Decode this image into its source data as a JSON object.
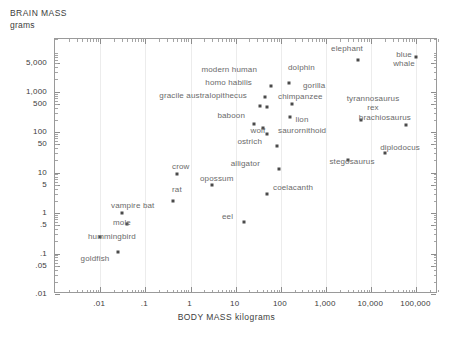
{
  "chart_data": {
    "type": "scatter",
    "title": "",
    "ylabel": "BRAIN MASS",
    "yunit": "grams",
    "xlabel": "BODY MASS kilograms",
    "xscale": "log",
    "yscale": "log",
    "xlim": [
      0.001,
      300000
    ],
    "ylim": [
      0.01,
      20000
    ],
    "grid": true,
    "legend": "none",
    "xticklabels": [
      ".01",
      ".1",
      "1",
      "10",
      "100",
      "1,000",
      "10,000",
      "100,000"
    ],
    "xtickvalues": [
      0.01,
      0.1,
      1,
      10,
      100,
      1000,
      10000,
      100000
    ],
    "yticklabels": [
      "5,000",
      "1,000",
      "500",
      "100",
      "50",
      "10",
      "5",
      "1",
      ".5",
      ".1",
      ".05",
      ".01"
    ],
    "ytickvalues": [
      5000,
      1000,
      500,
      100,
      50,
      10,
      5,
      1,
      0.5,
      0.1,
      0.05,
      0.01
    ],
    "points": [
      {
        "label": "blue whale",
        "x": 100000,
        "y": 7000,
        "lx": 404,
        "ly": 50,
        "anchor": "below",
        "lines": [
          "blue",
          "whale"
        ]
      },
      {
        "label": "elephant",
        "x": 5000,
        "y": 6000,
        "lx": 363,
        "ly": 48,
        "anchor": "left"
      },
      {
        "label": "modern human",
        "x": 60,
        "y": 1400,
        "lx": 257,
        "ly": 69,
        "anchor": "left"
      },
      {
        "label": "dolphin",
        "x": 150,
        "y": 1600,
        "lx": 288,
        "ly": 67,
        "anchor": "right"
      },
      {
        "label": "homo habilis",
        "x": 45,
        "y": 750,
        "lx": 252,
        "ly": 82,
        "anchor": "left"
      },
      {
        "label": "gorilla",
        "x": 180,
        "y": 500,
        "lx": 303,
        "ly": 85,
        "anchor": "right"
      },
      {
        "label": "gracile australopithecus",
        "x": 35,
        "y": 450,
        "lx": 247,
        "ly": 95,
        "anchor": "left"
      },
      {
        "label": "chimpanzee",
        "x": 50,
        "y": 420,
        "lx": 278,
        "ly": 96,
        "anchor": "right"
      },
      {
        "label": "tyrannosaurus rex",
        "x": 6000,
        "y": 200,
        "lx": 373,
        "ly": 94,
        "anchor": "below",
        "lines": [
          "tyrannosaurus",
          "rex"
        ]
      },
      {
        "label": "baboon",
        "x": 25,
        "y": 160,
        "lx": 245,
        "ly": 115,
        "anchor": "left"
      },
      {
        "label": "lion",
        "x": 160,
        "y": 240,
        "lx": 302,
        "ly": 115,
        "anchor": "below"
      },
      {
        "label": "brachiosaurus",
        "x": 60000,
        "y": 150,
        "lx": 411,
        "ly": 117,
        "anchor": "left"
      },
      {
        "label": "wolf",
        "x": 40,
        "y": 130,
        "lx": 258,
        "ly": 126,
        "anchor": "below"
      },
      {
        "label": "saurornithoid",
        "x": 50,
        "y": 90,
        "lx": 278,
        "ly": 130,
        "anchor": "right"
      },
      {
        "label": "ostrich",
        "x": 80,
        "y": 45,
        "lx": 262,
        "ly": 141,
        "anchor": "left"
      },
      {
        "label": "diplodocus",
        "x": 20000,
        "y": 30,
        "lx": 400,
        "ly": 143,
        "anchor": "below"
      },
      {
        "label": "alligator",
        "x": 90,
        "y": 12,
        "lx": 260,
        "ly": 163,
        "anchor": "left"
      },
      {
        "label": "stegosaurus",
        "x": 3000,
        "y": 20,
        "lx": 352,
        "ly": 157,
        "anchor": "below"
      },
      {
        "label": "crow",
        "x": 0.5,
        "y": 9,
        "lx": 172,
        "ly": 166,
        "anchor": "right"
      },
      {
        "label": "opossum",
        "x": 3,
        "y": 5,
        "lx": 200,
        "ly": 178,
        "anchor": "right"
      },
      {
        "label": "rat",
        "x": 0.4,
        "y": 2,
        "lx": 172,
        "ly": 189,
        "anchor": "right"
      },
      {
        "label": "coelacanth",
        "x": 50,
        "y": 3,
        "lx": 273,
        "ly": 187,
        "anchor": "right"
      },
      {
        "label": "vampire bat",
        "x": 0.03,
        "y": 1,
        "lx": 111,
        "ly": 205,
        "anchor": "right"
      },
      {
        "label": "eel",
        "x": 15,
        "y": 0.6,
        "lx": 222,
        "ly": 216,
        "anchor": "right"
      },
      {
        "label": "mole",
        "x": 0.04,
        "y": 0.55,
        "lx": 113,
        "ly": 222,
        "anchor": "right"
      },
      {
        "label": "hummingbird",
        "x": 0.01,
        "y": 0.25,
        "lx": 88,
        "ly": 236,
        "anchor": "right"
      },
      {
        "label": "goldfish",
        "x": 0.025,
        "y": 0.11,
        "lx": 95,
        "ly": 254,
        "anchor": "below"
      }
    ]
  },
  "axes": {
    "brain_mass_title": "BRAIN MASS",
    "brain_mass_unit": "grams",
    "body_mass_title": "BODY MASS kilograms"
  }
}
